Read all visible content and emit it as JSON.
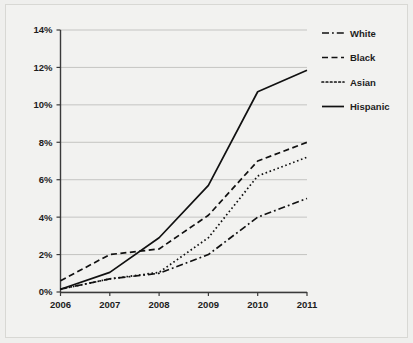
{
  "chart_data": {
    "type": "line",
    "title": "",
    "subtitle": "",
    "xlabel": "",
    "ylabel": "",
    "x": [
      2006,
      2007,
      2008,
      2009,
      2010,
      2011
    ],
    "x_tick_labels": [
      "2006",
      "2007",
      "2008",
      "2009",
      "2010",
      "2011"
    ],
    "y_tick_labels": [
      "0%",
      "2%",
      "4%",
      "6%",
      "8%",
      "10%",
      "12%",
      "14%"
    ],
    "y_ticks": [
      0,
      2,
      4,
      6,
      8,
      10,
      12,
      14
    ],
    "ylim": [
      0,
      14
    ],
    "xlim": [
      2006,
      2011
    ],
    "grid": "horizontal",
    "legend_position": "right",
    "value_suffix": "%",
    "series": [
      {
        "name": "White",
        "values": [
          0.15,
          0.7,
          1.0,
          2.0,
          4.0,
          5.0
        ],
        "dash": "dashdot",
        "color": "#111111"
      },
      {
        "name": "Black",
        "values": [
          0.6,
          2.0,
          2.3,
          4.1,
          7.0,
          8.0
        ],
        "dash": "dashed",
        "color": "#111111"
      },
      {
        "name": "Asian",
        "values": [
          0.15,
          0.7,
          1.05,
          2.9,
          6.2,
          7.2
        ],
        "dash": "dotted",
        "color": "#111111"
      },
      {
        "name": "Hispanic",
        "values": [
          0.15,
          1.05,
          2.9,
          5.7,
          10.7,
          11.85
        ],
        "dash": "solid",
        "color": "#111111"
      }
    ]
  },
  "legend": {
    "items": [
      {
        "label": "White"
      },
      {
        "label": "Black"
      },
      {
        "label": "Asian"
      },
      {
        "label": "Hispanic"
      }
    ]
  },
  "axes": {
    "y_labels": [
      "14%",
      "12%",
      "10%",
      "8%",
      "6%",
      "4%",
      "2%",
      "0%"
    ],
    "x_labels": [
      "2006",
      "2007",
      "2008",
      "2009",
      "2010",
      "2011"
    ]
  },
  "colors": {
    "background": "#efefed",
    "plot_background": "#f2f2f0",
    "gridline": "#b9b9b6",
    "axis": "#3a3a3a",
    "line": "#111111",
    "text": "#1d1d1d"
  }
}
